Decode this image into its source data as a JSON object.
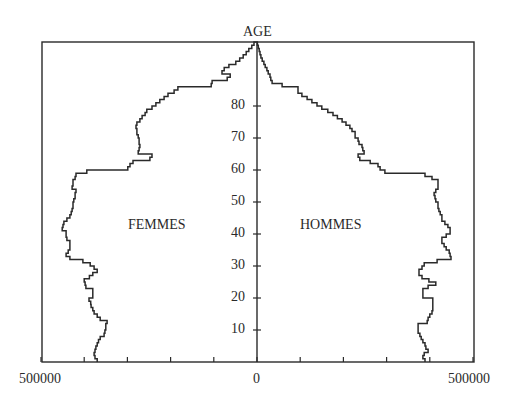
{
  "chart_data": {
    "type": "bar",
    "subtype": "population_pyramid",
    "title": "",
    "ylabel": "AGE",
    "xlabel": "",
    "left_series_label": "FEMMES",
    "right_series_label": "HOMMES",
    "x_tick_labels": {
      "left": "500000",
      "center": "0",
      "right": "500000"
    },
    "xlim": [
      -500000,
      500000
    ],
    "x_minor_ticks_step": 100000,
    "ylim": [
      0,
      100
    ],
    "y_ticks": [
      10,
      20,
      30,
      40,
      50,
      60,
      70,
      80
    ],
    "y_tick_labels": [
      "10",
      "20",
      "30",
      "40",
      "50",
      "60",
      "70",
      "80"
    ],
    "grid": false,
    "legend": "none (inline labels)",
    "line_color": "#2a2a2a",
    "ages": [
      0,
      1,
      2,
      3,
      4,
      5,
      6,
      7,
      8,
      9,
      10,
      11,
      12,
      13,
      14,
      15,
      16,
      17,
      18,
      19,
      20,
      21,
      22,
      23,
      24,
      25,
      26,
      27,
      28,
      29,
      30,
      31,
      32,
      33,
      34,
      35,
      36,
      37,
      38,
      39,
      40,
      41,
      42,
      43,
      44,
      45,
      46,
      47,
      48,
      49,
      50,
      51,
      52,
      53,
      54,
      55,
      56,
      57,
      58,
      59,
      60,
      61,
      62,
      63,
      64,
      65,
      66,
      67,
      68,
      69,
      70,
      71,
      72,
      73,
      74,
      75,
      76,
      77,
      78,
      79,
      80,
      81,
      82,
      83,
      84,
      85,
      86,
      87,
      88,
      89,
      90,
      91,
      92,
      93,
      94,
      95,
      96,
      97,
      98,
      99,
      100
    ],
    "series": [
      {
        "name": "FEMMES",
        "side": "left",
        "values": [
          370000,
          375000,
          377000,
          375000,
          373000,
          370000,
          367000,
          363000,
          354000,
          352000,
          350000,
          350000,
          347000,
          363000,
          370000,
          377000,
          380000,
          384000,
          385000,
          389000,
          380000,
          380000,
          380000,
          396000,
          398000,
          400000,
          388000,
          380000,
          370000,
          377000,
          386000,
          403000,
          433000,
          442000,
          437000,
          433000,
          433000,
          433000,
          440000,
          442000,
          442000,
          451000,
          449000,
          447000,
          440000,
          433000,
          430000,
          428000,
          426000,
          426000,
          424000,
          421000,
          421000,
          419000,
          428000,
          426000,
          426000,
          421000,
          419000,
          394000,
          299000,
          294000,
          287000,
          248000,
          243000,
          275000,
          273000,
          271000,
          273000,
          273000,
          275000,
          278000,
          278000,
          280000,
          278000,
          271000,
          266000,
          259000,
          255000,
          243000,
          234000,
          225000,
          215000,
          206000,
          192000,
          183000,
          106000,
          104000,
          69000,
          62000,
          81000,
          76000,
          65000,
          49000,
          40000,
          32000,
          25000,
          19000,
          12000,
          7000,
          2000
        ]
      },
      {
        "name": "HOMMES",
        "side": "right",
        "values": [
          389000,
          384000,
          387000,
          396000,
          391000,
          389000,
          384000,
          380000,
          377000,
          373000,
          373000,
          373000,
          394000,
          396000,
          400000,
          405000,
          407000,
          407000,
          407000,
          407000,
          384000,
          384000,
          384000,
          396000,
          414000,
          398000,
          382000,
          375000,
          375000,
          382000,
          387000,
          417000,
          449000,
          447000,
          445000,
          438000,
          433000,
          428000,
          428000,
          438000,
          447000,
          447000,
          442000,
          435000,
          428000,
          428000,
          424000,
          421000,
          419000,
          419000,
          414000,
          412000,
          410000,
          414000,
          419000,
          419000,
          419000,
          405000,
          389000,
          296000,
          285000,
          280000,
          262000,
          238000,
          234000,
          248000,
          245000,
          243000,
          236000,
          234000,
          227000,
          227000,
          220000,
          215000,
          206000,
          197000,
          186000,
          176000,
          164000,
          150000,
          139000,
          127000,
          116000,
          104000,
          95000,
          95000,
          58000,
          35000,
          32000,
          30000,
          26000,
          23000,
          19000,
          16000,
          12000,
          9000,
          7000,
          5000,
          3000,
          1000,
          0
        ]
      }
    ]
  },
  "labels": {
    "age_axis_title": "AGE",
    "femmes": "FEMMES",
    "hommes": "HOMMES",
    "x_left": "500000",
    "x_center": "0",
    "x_right": "500000"
  }
}
